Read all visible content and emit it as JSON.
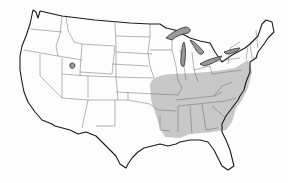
{
  "map": {
    "subject": "Contiguous United States",
    "highlighted_region": "Southeastern / Eastern-central United States",
    "highlighted_states": [
      "Missouri",
      "Illinois (southern)",
      "Indiana (southern)",
      "Ohio (southern)",
      "Kentucky",
      "Tennessee",
      "Arkansas",
      "Louisiana (northern)",
      "Mississippi",
      "Alabama",
      "Georgia",
      "South Carolina",
      "North Carolina",
      "Virginia",
      "West Virginia",
      "Maryland",
      "Delaware",
      "Pennsylvania (southern)",
      "New Jersey",
      "Oklahoma (eastern edge)",
      "Kansas (eastern edge)"
    ],
    "colors": {
      "shaded_fill": "#c8c8c8",
      "lakes_fill": "#9a9a9a",
      "state_border": "#5a5a5a",
      "coastline": "#1a1a1a",
      "background": "#ffffff"
    },
    "features": [
      "great-lakes",
      "great-salt-lake"
    ]
  }
}
